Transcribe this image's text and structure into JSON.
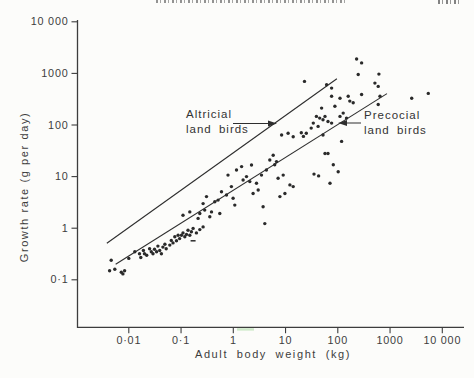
{
  "page": {
    "running_head": {
      "legible": false,
      "description": "clipped italic running-head text, cut off at top edge"
    },
    "page_number": {
      "legible": false,
      "description": "clipped page number, cut off at top-right edge"
    }
  },
  "colors": {
    "background": "#fcfcfa",
    "ink": "#2a2a2a",
    "axis": "#3d3d3d",
    "scan_artifact_green": "#a8d9a0"
  },
  "chart_data": {
    "type": "scatter",
    "title": "",
    "xlabel": "Adult body weight (kg)",
    "ylabel": "Growth rate (g per day)",
    "x_scale": "log",
    "y_scale": "log",
    "xlim": [
      0.003,
      20000
    ],
    "ylim": [
      0.03,
      10000
    ],
    "grid": false,
    "legend": "none",
    "x_ticks": [
      {
        "value": 0.01,
        "label": "0·01"
      },
      {
        "value": 0.1,
        "label": "0·1"
      },
      {
        "value": 1,
        "label": "1"
      },
      {
        "value": 10,
        "label": "10"
      },
      {
        "value": 100,
        "label": "100"
      },
      {
        "value": 1000,
        "label": "1000"
      },
      {
        "value": 10000,
        "label": "10 000"
      }
    ],
    "y_ticks": [
      {
        "value": 10000,
        "label": "10 000"
      },
      {
        "value": 1000,
        "label": "1000"
      },
      {
        "value": 100,
        "label": "100"
      },
      {
        "value": 10,
        "label": "10"
      },
      {
        "value": 1,
        "label": "1"
      },
      {
        "value": 0.1,
        "label": "0·1"
      }
    ],
    "reference_lines": [
      {
        "name": "Altricial land birds",
        "from": [
          0.0038,
          0.51
        ],
        "to": [
          96,
          790
        ]
      },
      {
        "name": "Precocial land birds",
        "from": [
          0.0056,
          0.2
        ],
        "to": [
          873,
          405
        ]
      }
    ],
    "annotations": [
      {
        "text_lines": [
          "Altricial",
          "land birds"
        ],
        "arrow_direction": "right",
        "points_to": "upper reference line"
      },
      {
        "text_lines": [
          "Precocial",
          "land birds"
        ],
        "arrow_direction": "left",
        "points_to": "lower reference line"
      }
    ],
    "artifacts": {
      "dash_mark_xy": [
        0.17,
        0.57
      ],
      "green_smudge_on_x_axis_near_kg": 2
    },
    "series": [
      {
        "name": "land bird species (growth rate vs adult weight)",
        "marker": "dot",
        "points": [
          [
            0.0046,
            0.24
          ],
          [
            0.0054,
            0.16
          ],
          [
            0.0043,
            0.15
          ],
          [
            0.0072,
            0.14
          ],
          [
            0.0083,
            0.15
          ],
          [
            0.0077,
            0.13
          ],
          [
            0.01,
            0.26
          ],
          [
            0.013,
            0.35
          ],
          [
            0.016,
            0.32
          ],
          [
            0.019,
            0.37
          ],
          [
            0.02,
            0.32
          ],
          [
            0.022,
            0.3
          ],
          [
            0.017,
            0.27
          ],
          [
            0.025,
            0.4
          ],
          [
            0.027,
            0.35
          ],
          [
            0.029,
            0.32
          ],
          [
            0.031,
            0.39
          ],
          [
            0.034,
            0.35
          ],
          [
            0.036,
            0.45
          ],
          [
            0.039,
            0.37
          ],
          [
            0.042,
            0.32
          ],
          [
            0.045,
            0.43
          ],
          [
            0.049,
            0.49
          ],
          [
            0.052,
            0.4
          ],
          [
            0.061,
            0.47
          ],
          [
            0.065,
            0.58
          ],
          [
            0.07,
            0.52
          ],
          [
            0.076,
            0.68
          ],
          [
            0.082,
            0.57
          ],
          [
            0.088,
            0.73
          ],
          [
            0.094,
            0.63
          ],
          [
            0.102,
            0.73
          ],
          [
            0.109,
            0.81
          ],
          [
            0.118,
            0.68
          ],
          [
            0.127,
            0.76
          ],
          [
            0.136,
            0.91
          ],
          [
            0.147,
            0.73
          ],
          [
            0.158,
            0.85
          ],
          [
            0.17,
            0.99
          ],
          [
            0.197,
            0.81
          ],
          [
            0.228,
            0.94
          ],
          [
            0.264,
            1.06
          ],
          [
            0.109,
            1.79
          ],
          [
            0.147,
            2.07
          ],
          [
            0.212,
            1.55
          ],
          [
            0.228,
            1.93
          ],
          [
            0.284,
            2.24
          ],
          [
            0.264,
            3.0
          ],
          [
            0.307,
            4.1
          ],
          [
            0.355,
            1.66
          ],
          [
            0.382,
            2.07
          ],
          [
            0.442,
            3.25
          ],
          [
            0.512,
            3.5
          ],
          [
            0.551,
            1.93
          ],
          [
            0.594,
            5.1
          ],
          [
            0.741,
            4.4
          ],
          [
            0.79,
            10.7
          ],
          [
            0.92,
            6.4
          ],
          [
            0.99,
            3.8
          ],
          [
            1.07,
            2.8
          ],
          [
            1.15,
            13.4
          ],
          [
            1.44,
            15.6
          ],
          [
            1.54,
            8.6
          ],
          [
            1.79,
            10.0
          ],
          [
            2.07,
            8.0
          ],
          [
            2.23,
            16.8
          ],
          [
            2.39,
            4.7
          ],
          [
            2.78,
            7.4
          ],
          [
            2.99,
            5.5
          ],
          [
            3.47,
            10.7
          ],
          [
            3.72,
            2.6
          ],
          [
            4.0,
            1.23
          ],
          [
            4.3,
            13.4
          ],
          [
            5.0,
            21
          ],
          [
            5.8,
            26
          ],
          [
            6.2,
            17
          ],
          [
            6.7,
            19.5
          ],
          [
            7.2,
            9.3
          ],
          [
            7.8,
            4.1
          ],
          [
            9.0,
            10.7
          ],
          [
            9.7,
            4.7
          ],
          [
            12.1,
            6.9
          ],
          [
            14,
            6.4
          ],
          [
            35,
            11.2
          ],
          [
            43,
            10.3
          ],
          [
            8.4,
            64
          ],
          [
            11.2,
            69
          ],
          [
            14,
            59
          ],
          [
            20,
            71
          ],
          [
            229,
            1900
          ],
          [
            286,
            1600
          ],
          [
            246,
            950
          ],
          [
            612,
            970
          ],
          [
            514,
            650
          ],
          [
            594,
            560
          ],
          [
            110,
            330
          ],
          [
            158,
            360
          ],
          [
            170,
            290
          ],
          [
            286,
            390
          ],
          [
            197,
            270
          ],
          [
            76,
            360
          ],
          [
            641,
            360
          ],
          [
            594,
            250
          ],
          [
            88,
            230
          ],
          [
            49,
            213
          ],
          [
            39,
            147
          ],
          [
            45,
            136
          ],
          [
            52,
            126
          ],
          [
            57,
            147
          ],
          [
            65,
            117
          ],
          [
            76,
            109
          ],
          [
            34,
            109
          ],
          [
            42,
            94
          ],
          [
            31,
            87
          ],
          [
            25,
            69
          ],
          [
            22,
            60
          ],
          [
            52,
            64
          ],
          [
            110,
            147
          ],
          [
            127,
            170
          ],
          [
            147,
            136
          ],
          [
            118,
            48
          ],
          [
            65,
            28
          ],
          [
            82,
            17
          ],
          [
            102,
            12.4
          ],
          [
            57,
            28
          ],
          [
            71,
            7.4
          ],
          [
            2600,
            330
          ],
          [
            5400,
            410
          ],
          [
            23,
            700
          ],
          [
            61,
            605
          ],
          [
            76,
            520
          ]
        ]
      }
    ]
  }
}
